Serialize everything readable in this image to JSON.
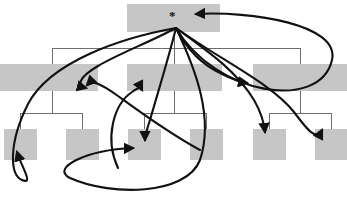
{
  "figure": {
    "type": "node-link-diagram",
    "width": 347,
    "height": 209,
    "background": "#ffffff",
    "node_fill": "#c6c6c6",
    "tree_line_color": "#6e6e6e",
    "arrow_color": "#111111"
  },
  "root": {
    "label": "*",
    "name": "root-node",
    "x": 127,
    "y": 4,
    "w": 93,
    "h": 28
  },
  "levels": [
    {
      "name": "level-1",
      "nodes": [
        {
          "name": "node-1-1",
          "label": "",
          "x": 127,
          "y": 4,
          "w": 93,
          "h": 28
        }
      ]
    },
    {
      "name": "level-2",
      "nodes": [
        {
          "name": "node-2-1",
          "label": "",
          "x": 0,
          "y": 64,
          "w": 98,
          "h": 27
        },
        {
          "name": "node-2-2",
          "label": "",
          "x": 127,
          "y": 64,
          "w": 95,
          "h": 27
        },
        {
          "name": "node-2-3",
          "label": "",
          "x": 253,
          "y": 64,
          "w": 94,
          "h": 27
        }
      ]
    },
    {
      "name": "level-3",
      "nodes": [
        {
          "name": "node-3-1",
          "label": "",
          "x": 4,
          "y": 129,
          "w": 33,
          "h": 31
        },
        {
          "name": "node-3-2",
          "label": "",
          "x": 66,
          "y": 129,
          "w": 33,
          "h": 31
        },
        {
          "name": "node-3-3",
          "label": "",
          "x": 128,
          "y": 129,
          "w": 33,
          "h": 31
        },
        {
          "name": "node-3-4",
          "label": "",
          "x": 190,
          "y": 129,
          "w": 33,
          "h": 31
        },
        {
          "name": "node-3-5",
          "label": "",
          "x": 253,
          "y": 129,
          "w": 33,
          "h": 31
        },
        {
          "name": "node-3-6",
          "label": "",
          "x": 315,
          "y": 129,
          "w": 32,
          "h": 31
        }
      ]
    }
  ],
  "tree_edges": {
    "name": "tree-connectors",
    "level1_bus_y": 48,
    "level1_bus_x0": 52,
    "level1_bus_x1": 300,
    "level2_bus_y": 113,
    "branches": [
      {
        "parent_x": 52,
        "bus_x0": 20,
        "bus_x1": 82
      },
      {
        "parent_x": 174,
        "bus_x0": 144,
        "bus_x1": 206
      },
      {
        "parent_x": 300,
        "bus_x0": 269,
        "bus_x1": 331
      }
    ]
  },
  "curved_arrows": [
    {
      "name": "arrow-root-to-self-right",
      "from": "root",
      "to": "root"
    },
    {
      "name": "arrow-root-to-node-2-1",
      "from": "root",
      "to": "node-2-1"
    },
    {
      "name": "arrow-root-to-node-2-3",
      "from": "root",
      "to": "node-2-3"
    },
    {
      "name": "arrow-root-to-node-3-1",
      "from": "root",
      "to": "node-3-1"
    },
    {
      "name": "arrow-root-to-node-3-3-a",
      "from": "root",
      "to": "node-3-3"
    },
    {
      "name": "arrow-root-to-node-3-3-b",
      "from": "root",
      "to": "node-3-3"
    },
    {
      "name": "arrow-root-to-node-3-5",
      "from": "root",
      "to": "node-3-5"
    },
    {
      "name": "arrow-root-to-node-3-6",
      "from": "root",
      "to": "node-3-6"
    },
    {
      "name": "arrow-upward-to-node-2-2",
      "from": "node-3-3",
      "to": "node-2-2"
    }
  ]
}
